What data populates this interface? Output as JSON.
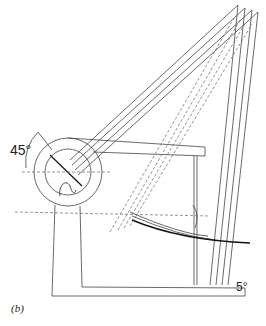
{
  "figure": {
    "panel_label": "(b)",
    "angle_label_left": "45°",
    "angle_label_bottom": "5°",
    "line_color": "#444444",
    "dash_color": "#666666",
    "ground_curve_color": "#111111"
  }
}
